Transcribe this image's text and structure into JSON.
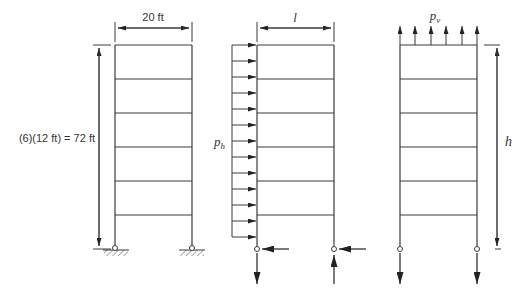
{
  "labels": {
    "width_dim": "20 ft",
    "height_dim": "(6)(12 ft) = 72 ft",
    "span_symbol": "l",
    "horizontal_load": "p",
    "horizontal_load_sub": "h",
    "vertical_load": "p",
    "vertical_load_sub": "v",
    "height_symbol": "h"
  },
  "colors": {
    "line": "#3a3a3a",
    "arrow": "#222222",
    "text": "#333333",
    "background": "#ffffff"
  },
  "frames": [
    {
      "name": "building-frame",
      "stories": 6,
      "story_height_ft": 12,
      "bay_width_ft": 20,
      "supports": "pinned"
    },
    {
      "name": "horizontal-load-frame",
      "stories": 6,
      "load": "lateral distributed p_h",
      "load_arrow_count": 13
    },
    {
      "name": "vertical-load-frame",
      "stories": 6,
      "load": "vertical distributed p_v",
      "load_arrow_count": 6
    }
  ]
}
